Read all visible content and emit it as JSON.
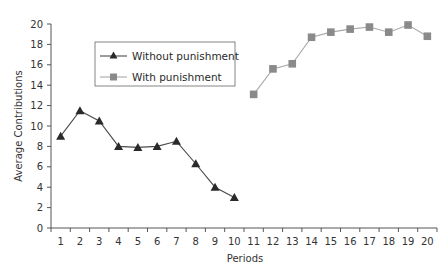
{
  "chart_data": {
    "type": "line",
    "title": "",
    "xlabel": "Periods",
    "ylabel": "Average Contributions",
    "x": [
      1,
      2,
      3,
      4,
      5,
      6,
      7,
      8,
      9,
      10,
      11,
      12,
      13,
      14,
      15,
      16,
      17,
      18,
      19,
      20
    ],
    "ylim": [
      0,
      20
    ],
    "yticks": [
      0,
      2,
      4,
      6,
      8,
      10,
      12,
      14,
      16,
      18,
      20
    ],
    "xticks": [
      "1",
      "2",
      "3",
      "4",
      "5",
      "6",
      "7",
      "8",
      "9",
      "10",
      "11",
      "12",
      "13",
      "14",
      "15",
      "16",
      "17",
      "18",
      "19",
      "20"
    ],
    "grid": false,
    "legend_position": "upper-left (inside plot)",
    "series": [
      {
        "name": "Without punishment",
        "marker": "triangle",
        "color": "#2a2a2a",
        "x": [
          1,
          2,
          3,
          4,
          5,
          6,
          7,
          8,
          9,
          10
        ],
        "values": [
          9.0,
          11.5,
          10.5,
          8.0,
          7.9,
          8.0,
          8.5,
          6.3,
          4.0,
          3.0
        ]
      },
      {
        "name": "With punishment",
        "marker": "square",
        "color": "#8a8a8a",
        "x": [
          11,
          12,
          13,
          14,
          15,
          16,
          17,
          18,
          19,
          20
        ],
        "values": [
          13.1,
          15.6,
          16.1,
          18.7,
          19.2,
          19.5,
          19.7,
          19.2,
          19.9,
          18.8
        ]
      }
    ]
  },
  "legend": {
    "items": [
      {
        "label": "Without punishment",
        "marker": "triangle-icon"
      },
      {
        "label": "With punishment",
        "marker": "square-icon"
      }
    ]
  },
  "axes": {
    "x_title": "Periods",
    "y_title": "Average Contributions"
  },
  "colors": {
    "axis": "#555555",
    "series_without": "#2a2a2a",
    "series_without_line": "#4a4a4a",
    "series_with": "#8a8a8a",
    "series_with_line": "#a8a8a8"
  }
}
